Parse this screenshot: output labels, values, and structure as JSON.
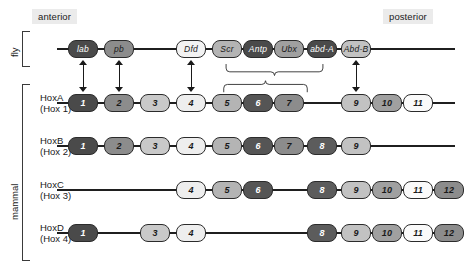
{
  "figure": {
    "orientation": {
      "anterior_label": "anterior",
      "posterior_label": "posterior"
    },
    "groups": [
      {
        "id": "fly",
        "label": "fly"
      },
      {
        "id": "mammal",
        "label": "mammal"
      }
    ],
    "columns": {
      "count": 13,
      "numbers": [
        1,
        2,
        3,
        4,
        5,
        6,
        7,
        8,
        9,
        10,
        11,
        12,
        13
      ],
      "x": [
        68,
        104,
        140,
        176,
        212,
        243,
        274,
        307,
        341,
        372,
        403,
        434,
        464
      ]
    },
    "shades": {
      "darkest": "#3a3a3a",
      "dark": "#555555",
      "mid_dark": "#6e6e6e",
      "mid": "#8c8c8c",
      "mid_light": "#a9a9a9",
      "light": "#c9c9c9",
      "lighter": "#e0e0e0",
      "lightest": "#f2f2f2",
      "outline": "#2b2b2b",
      "line": "#1f1f1f",
      "label_bg": "#ebebeb"
    },
    "rows": [
      {
        "id": "fly",
        "organism": "fly",
        "name": "",
        "name2": "",
        "genes": [
          {
            "label": "lab",
            "col": 1,
            "fill": "#4a4a4a",
            "text": "#ffffff"
          },
          {
            "label": "pb",
            "col": 2,
            "fill": "#8c8c8c",
            "text": "#1a1a1a"
          },
          {
            "label": "Dfd",
            "col": 4,
            "fill": "#f2f2f2",
            "text": "#1a1a1a"
          },
          {
            "label": "Scr",
            "col": 5,
            "fill": "#b4b4b4",
            "text": "#1a1a1a"
          },
          {
            "label": "Antp",
            "col": 6,
            "fill": "#4a4a4a",
            "text": "#ffffff"
          },
          {
            "label": "Ubx",
            "col": 7,
            "fill": "#a0a0a0",
            "text": "#1a1a1a"
          },
          {
            "label": "abd-A",
            "col": 8,
            "fill": "#4a4a4a",
            "text": "#ffffff"
          },
          {
            "label": "Abd-B",
            "col": 9,
            "fill": "#c2c2c2",
            "text": "#1a1a1a"
          }
        ]
      },
      {
        "id": "hoxa",
        "organism": "mammal",
        "name": "HoxA",
        "name2": "(Hox 1)",
        "genes": [
          {
            "label": "1",
            "col": 1,
            "fill": "#4a4a4a",
            "text": "#ffffff"
          },
          {
            "label": "2",
            "col": 2,
            "fill": "#8c8c8c",
            "text": "#1a1a1a"
          },
          {
            "label": "3",
            "col": 3,
            "fill": "#c9c9c9",
            "text": "#1a1a1a"
          },
          {
            "label": "4",
            "col": 4,
            "fill": "#eeeeee",
            "text": "#1a1a1a"
          },
          {
            "label": "5",
            "col": 5,
            "fill": "#b4b4b4",
            "text": "#1a1a1a"
          },
          {
            "label": "6",
            "col": 6,
            "fill": "#555555",
            "text": "#ffffff"
          },
          {
            "label": "7",
            "col": 7,
            "fill": "#8c8c8c",
            "text": "#1a1a1a"
          },
          {
            "label": "9",
            "col": 9,
            "fill": "#c2c2c2",
            "text": "#1a1a1a"
          },
          {
            "label": "10",
            "col": 10,
            "fill": "#a0a0a0",
            "text": "#1a1a1a"
          },
          {
            "label": "11",
            "col": 11,
            "fill": "#fafafa",
            "text": "#1a1a1a"
          },
          {
            "label": "13",
            "col": 13,
            "fill": "#b4b4b4",
            "text": "#1a1a1a"
          }
        ]
      },
      {
        "id": "hoxb",
        "organism": "mammal",
        "name": "HoxB",
        "name2": "(Hox 2)",
        "genes": [
          {
            "label": "1",
            "col": 1,
            "fill": "#4a4a4a",
            "text": "#ffffff"
          },
          {
            "label": "2",
            "col": 2,
            "fill": "#8c8c8c",
            "text": "#1a1a1a"
          },
          {
            "label": "3",
            "col": 3,
            "fill": "#c9c9c9",
            "text": "#1a1a1a"
          },
          {
            "label": "4",
            "col": 4,
            "fill": "#eeeeee",
            "text": "#1a1a1a"
          },
          {
            "label": "5",
            "col": 5,
            "fill": "#b4b4b4",
            "text": "#1a1a1a"
          },
          {
            "label": "6",
            "col": 6,
            "fill": "#555555",
            "text": "#ffffff"
          },
          {
            "label": "7",
            "col": 7,
            "fill": "#8c8c8c",
            "text": "#1a1a1a"
          },
          {
            "label": "8",
            "col": 8,
            "fill": "#5c5c5c",
            "text": "#ffffff"
          },
          {
            "label": "9",
            "col": 9,
            "fill": "#c2c2c2",
            "text": "#1a1a1a"
          }
        ]
      },
      {
        "id": "hoxc",
        "organism": "mammal",
        "name": "HoxC",
        "name2": "(Hox 3)",
        "genes": [
          {
            "label": "4",
            "col": 4,
            "fill": "#eeeeee",
            "text": "#1a1a1a"
          },
          {
            "label": "5",
            "col": 5,
            "fill": "#b4b4b4",
            "text": "#1a1a1a"
          },
          {
            "label": "6",
            "col": 6,
            "fill": "#555555",
            "text": "#ffffff"
          },
          {
            "label": "8",
            "col": 8,
            "fill": "#5c5c5c",
            "text": "#ffffff"
          },
          {
            "label": "9",
            "col": 9,
            "fill": "#c2c2c2",
            "text": "#1a1a1a"
          },
          {
            "label": "10",
            "col": 10,
            "fill": "#a0a0a0",
            "text": "#1a1a1a"
          },
          {
            "label": "11",
            "col": 11,
            "fill": "#fafafa",
            "text": "#1a1a1a"
          },
          {
            "label": "12",
            "col": 12,
            "fill": "#8c8c8c",
            "text": "#1a1a1a"
          },
          {
            "label": "13",
            "col": 13,
            "fill": "#b4b4b4",
            "text": "#1a1a1a"
          }
        ]
      },
      {
        "id": "hoxd",
        "organism": "mammal",
        "name": "HoxD",
        "name2": "(Hox 4)",
        "genes": [
          {
            "label": "1",
            "col": 1,
            "fill": "#4a4a4a",
            "text": "#ffffff"
          },
          {
            "label": "3",
            "col": 3,
            "fill": "#c9c9c9",
            "text": "#1a1a1a"
          },
          {
            "label": "4",
            "col": 4,
            "fill": "#eeeeee",
            "text": "#1a1a1a"
          },
          {
            "label": "8",
            "col": 8,
            "fill": "#5c5c5c",
            "text": "#ffffff"
          },
          {
            "label": "9",
            "col": 9,
            "fill": "#c2c2c2",
            "text": "#1a1a1a"
          },
          {
            "label": "10",
            "col": 10,
            "fill": "#a0a0a0",
            "text": "#1a1a1a"
          },
          {
            "label": "11",
            "col": 11,
            "fill": "#fafafa",
            "text": "#1a1a1a"
          },
          {
            "label": "12",
            "col": 12,
            "fill": "#8c8c8c",
            "text": "#1a1a1a"
          },
          {
            "label": "13",
            "col": 13,
            "fill": "#b4b4b4",
            "text": "#1a1a1a"
          }
        ]
      }
    ],
    "homology_arrows": [
      {
        "id": "lab-hox1",
        "from": "lab",
        "to": "1",
        "col": 1
      },
      {
        "id": "pb-hox2",
        "from": "pb",
        "to": "2",
        "col": 2
      },
      {
        "id": "dfd-hox4",
        "from": "Dfd",
        "to": "4",
        "col": 4
      },
      {
        "id": "abdb-hox9",
        "from": "Abd-B",
        "to": "9",
        "col": 9
      }
    ],
    "homology_braces": [
      {
        "id": "fly-scr-abda",
        "from": "Scr",
        "to": "abd-A",
        "side": "fly"
      },
      {
        "id": "hoxa-5-to-7",
        "from": "5",
        "to": "7",
        "side": "mammal"
      }
    ]
  }
}
